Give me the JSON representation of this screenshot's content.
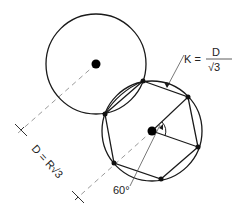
{
  "diagram": {
    "labels": {
      "k_formula_lhs": "K =",
      "k_formula_num": "D",
      "k_formula_den": "√3",
      "dimension_label": "D = R√3",
      "angle_label": "60°"
    },
    "circles": [
      {
        "name": "upper-circle",
        "cx": 96,
        "cy": 64,
        "r": 50
      },
      {
        "name": "lower-circle",
        "cx": 152,
        "cy": 131,
        "r": 50
      }
    ],
    "hexagon_vertices": [
      [
        143,
        81
      ],
      [
        188,
        97
      ],
      [
        198,
        147
      ],
      [
        161,
        179
      ],
      [
        114,
        163
      ],
      [
        105,
        114
      ]
    ],
    "colors": {
      "stroke": "#1a1a1a",
      "dash": "#9a9a9a",
      "text": "#222222"
    }
  }
}
